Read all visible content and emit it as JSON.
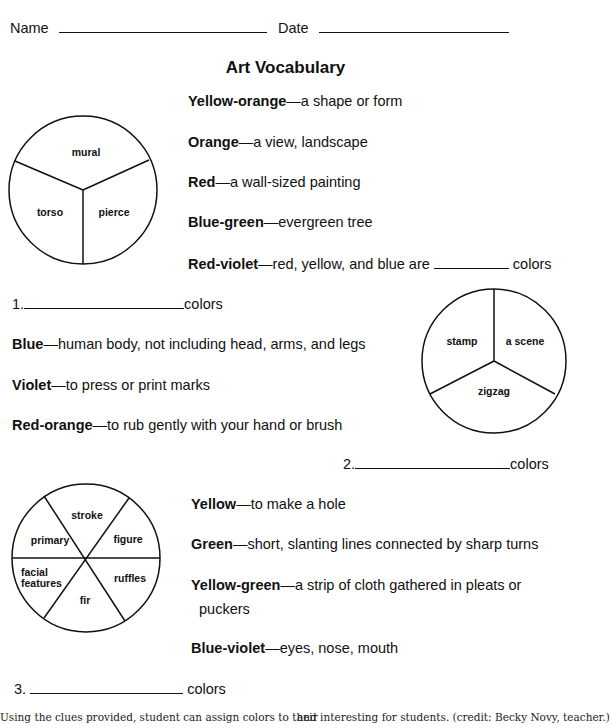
{
  "header": {
    "name_label": "Name",
    "date_label": "Date"
  },
  "title": "Art Vocabulary",
  "section1": {
    "definitions": [
      {
        "color": "Yellow-orange",
        "text": "—a shape or form"
      },
      {
        "color": "Orange",
        "text": "—a view, landscape"
      },
      {
        "color": "Red",
        "text": "—a wall-sized painting"
      },
      {
        "color": "Blue-green",
        "text": "—evergreen tree"
      },
      {
        "color": "Red-violet",
        "text": "—red, yellow, and blue are",
        "suffix": "colors"
      }
    ],
    "wheel": [
      "mural",
      "torso",
      "pierce"
    ],
    "answer": {
      "number": "1.",
      "suffix": "colors"
    }
  },
  "section2": {
    "definitions": [
      {
        "color": "Blue",
        "text": "—human body, not including head, arms, and legs"
      },
      {
        "color": "Violet",
        "text": "—to press or print marks"
      },
      {
        "color": "Red-orange",
        "text": "—to rub gently with your hand or brush"
      }
    ],
    "wheel": [
      "stamp",
      "a scene",
      "zigzag"
    ],
    "answer": {
      "number": "2.",
      "suffix": "colors"
    }
  },
  "section3": {
    "definitions": [
      {
        "color": "Yellow",
        "text": "—to make a hole"
      },
      {
        "color": "Green",
        "text": "—short, slanting lines connected by sharp turns"
      },
      {
        "color": "Yellow-green",
        "text": "—a strip of cloth gathered in pleats or",
        "line2": "puckers"
      },
      {
        "color": "Blue-violet",
        "text": "—eyes, nose, mouth"
      }
    ],
    "wheel": [
      "stroke",
      "figure",
      "ruffles",
      "fir",
      "facial",
      "features",
      "primary"
    ],
    "answer": {
      "number": "3.",
      "suffix": "colors"
    }
  },
  "footer": {
    "left": "Using the clues provided, student can assign colors to their",
    "right": "and interesting for students. (credit: Becky Novy, teacher.)"
  }
}
